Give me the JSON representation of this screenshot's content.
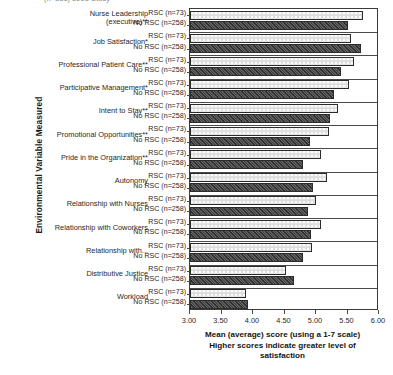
{
  "top_partial_title": "(n=331) 2003 Study",
  "axis": {
    "y_title": "Environmental Variable Measured",
    "x_title_line1": "Mean (average) score (using a 1-7 scale)",
    "x_title_line2": "Higher scores indicate greater level of",
    "x_title_line3": "satisfaction",
    "x_ticks": [
      "3.00",
      "3.50",
      "4.00",
      "4.50",
      "5.00",
      "5.50",
      "6.00"
    ],
    "x_min": 3.0,
    "x_max": 6.0
  },
  "series_labels": {
    "rsc": "RSC (n=73)",
    "no_rsc": "No RSC (n=258)"
  },
  "chart_data": {
    "type": "bar",
    "orientation": "horizontal",
    "title": "",
    "xlabel": "Mean (average) score (using a 1-7 scale) Higher scores indicate greater level of satisfaction",
    "ylabel": "Environmental Variable Measured",
    "xlim": [
      3.0,
      6.0
    ],
    "grid": false,
    "legend_position": "none",
    "categories": [
      "Nurse Leadership (executive)**",
      "Job Satisfaction*",
      "Professional Patient Care**",
      "Participative Management*",
      "Intent to Stay**",
      "Promotional Opportunities**",
      "Pride in the Organization**",
      "Autonomy",
      "Relationship with Nurses",
      "Relationship with Coworkers",
      "Relationship with...",
      "Distributive Justice",
      "Workload"
    ],
    "series": [
      {
        "name": "RSC (n=73)",
        "values": [
          5.75,
          5.55,
          5.6,
          5.52,
          5.35,
          5.2,
          5.08,
          5.18,
          5.0,
          5.08,
          4.93,
          4.52,
          3.89
        ]
      },
      {
        "name": "No RSC (n=258)",
        "values": [
          5.5,
          5.72,
          5.4,
          5.28,
          5.22,
          4.9,
          4.8,
          4.95,
          4.88,
          4.92,
          4.8,
          4.65,
          3.92
        ]
      }
    ]
  }
}
